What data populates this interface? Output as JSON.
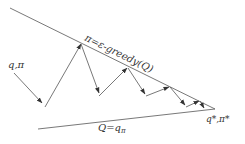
{
  "diagram": {
    "labels": {
      "start": "q,π",
      "upper_line": "π=ε-greedy(Q)",
      "lower_line": "Q=q",
      "lower_line_sub": "π",
      "end": "q*,π*"
    },
    "colors": {
      "line": "#555555",
      "text": "#333333",
      "background": "#ffffff"
    },
    "upper_line": {
      "from": [
        10,
        8
      ],
      "to": [
        215,
        109
      ]
    },
    "lower_line": {
      "from": [
        38,
        129
      ],
      "to": [
        215,
        109
      ]
    },
    "zigzag_points": [
      [
        14,
        73
      ],
      [
        42,
        103
      ],
      [
        81,
        44
      ],
      [
        99,
        96
      ],
      [
        128,
        68
      ],
      [
        146,
        96
      ],
      [
        170,
        87
      ],
      [
        186,
        107
      ],
      [
        200,
        101
      ],
      [
        207,
        103
      ]
    ]
  }
}
